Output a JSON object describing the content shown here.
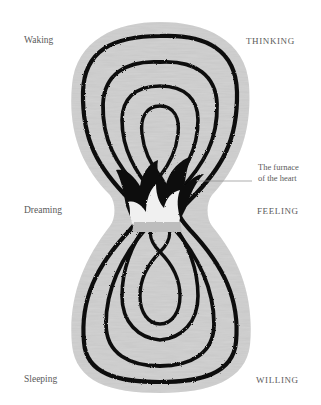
{
  "diagram": {
    "type": "lemniscate-illustration",
    "colors": {
      "background": "#ffffff",
      "field": "#c9c9c9",
      "stroke": "#111111",
      "flame_light": "#f2f2f2",
      "label_text": "#5a5a5a",
      "leader_line": "#8a8a8a"
    }
  },
  "labels": {
    "left": {
      "top": "Waking",
      "middle": "Dreaming",
      "bottom": "Sleeping"
    },
    "right": {
      "top": "THINKING",
      "middle": "FEELING",
      "bottom": "WILLING"
    },
    "annotation": {
      "line1": "The furnace",
      "line2": "of the heart"
    }
  }
}
